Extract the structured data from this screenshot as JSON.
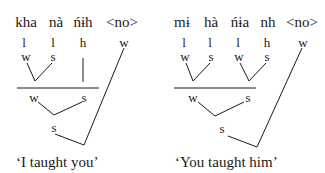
{
  "trees": [
    {
      "id": "left",
      "words": [
        "kha",
        "nà",
        "ńɨh",
        "<no>"
      ],
      "syllable_weights": [
        "l",
        "l",
        "h",
        "w"
      ],
      "foot_labels": [
        "w",
        "s"
      ],
      "word_level": [
        "w",
        "s"
      ],
      "top_level": "s",
      "caption": "‘I taught you’"
    },
    {
      "id": "right",
      "words": [
        "mɨ",
        "hà",
        "ńɨa",
        "nh",
        "<no>"
      ],
      "syllable_weights": [
        "l",
        "l",
        "l",
        "h",
        "w"
      ],
      "foot_labels": [
        "w",
        "s",
        "w",
        "s"
      ],
      "word_level": [
        "w",
        "s"
      ],
      "top_level": "s",
      "caption": "‘You taught him’"
    }
  ]
}
